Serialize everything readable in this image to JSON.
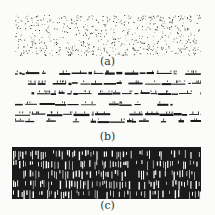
{
  "figure": {
    "panels": [
      {
        "id": "a",
        "label": "(a)",
        "pattern": "scattered-dots"
      },
      {
        "id": "b",
        "label": "(b)",
        "pattern": "horizontal-streaks"
      },
      {
        "id": "c",
        "label": "(c)",
        "pattern": "dense-vertical-strokes"
      }
    ],
    "colors": {
      "ink": "#1a1a1a",
      "paper": "#fbfbfa"
    }
  }
}
